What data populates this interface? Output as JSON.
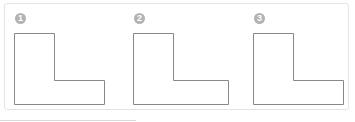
{
  "figures": [
    {
      "number": "1",
      "badge": "❶",
      "shape": "L-shape"
    },
    {
      "number": "2",
      "badge": "❷",
      "shape": "L-shape"
    },
    {
      "number": "3",
      "badge": "❸",
      "shape": "L-shape"
    }
  ],
  "colors": {
    "stroke": "#888888",
    "badge": "#b3b3b3",
    "border": "#e4e4e4"
  }
}
